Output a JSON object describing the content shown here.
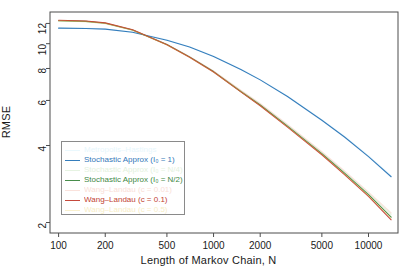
{
  "chart_data": {
    "type": "line",
    "title": "",
    "xlabel": "Length of Markov Chain, N",
    "ylabel": "RMSE",
    "xscale": "log",
    "yscale": "log",
    "xlim": [
      88,
      15500
    ],
    "ylim": [
      1.82,
      13.3
    ],
    "xticks": [
      100,
      200,
      500,
      1000,
      2000,
      5000,
      10000
    ],
    "xtick_labels": [
      "100",
      "200",
      "500",
      "1000",
      "2000",
      "5000",
      "10000"
    ],
    "yticks": [
      2,
      4,
      6,
      8,
      10,
      12
    ],
    "ytick_labels": [
      "2",
      "4",
      "6",
      "8",
      "10",
      "12"
    ],
    "grid": false,
    "legend_position": "lower-left-inside",
    "x": [
      100,
      150,
      200,
      300,
      500,
      700,
      1000,
      1500,
      2000,
      3000,
      5000,
      7000,
      10000,
      14000
    ],
    "series": [
      {
        "name": "Metropolis-Hastings",
        "label": "Metropolis–Hastings",
        "color": "#7fd4f2",
        "opacity": 0.16,
        "values": [
          11.55,
          11.5,
          11.42,
          11.1,
          10.35,
          9.72,
          8.95,
          7.95,
          7.25,
          6.25,
          5.05,
          4.35,
          3.65,
          3.05
        ]
      },
      {
        "name": "Stochastic Approx (I0 = 1)",
        "label": "Stochastic Approx (I₀ = 1)",
        "color": "#1f6fb5",
        "opacity": 0.9,
        "values": [
          11.5,
          11.46,
          11.4,
          11.08,
          10.32,
          9.7,
          8.92,
          7.92,
          7.22,
          6.22,
          5.02,
          4.32,
          3.62,
          3.02
        ]
      },
      {
        "name": "Stochastic Approx (I0 = N/4)",
        "label": "Stochastic Approx (I₀ = N/4)",
        "color": "#8ec77a",
        "opacity": 0.22,
        "values": [
          12.3,
          12.2,
          12.0,
          11.3,
          9.9,
          8.9,
          7.8,
          6.55,
          5.8,
          4.8,
          3.75,
          3.15,
          2.6,
          2.15
        ]
      },
      {
        "name": "Stochastic Approx (I0 = N/2)",
        "label": "Stochastic Approx (I₀ = N/2)",
        "color": "#2f7d32",
        "opacity": 0.88,
        "values": [
          12.3,
          12.22,
          12.02,
          11.32,
          9.92,
          8.88,
          7.78,
          6.5,
          5.76,
          4.76,
          3.72,
          3.12,
          2.57,
          2.1
        ]
      },
      {
        "name": "Wang-Landau (c = 0.01)",
        "label": "Wang–Landau (c = 0.01)",
        "color": "#f0a08a",
        "opacity": 0.3,
        "values": [
          12.32,
          12.24,
          12.05,
          11.35,
          9.95,
          8.92,
          7.82,
          6.58,
          5.84,
          4.84,
          3.78,
          3.18,
          2.63,
          2.18
        ]
      },
      {
        "name": "Wang-Landau (c = 0.1)",
        "label": "Wang–Landau (c = 0.1)",
        "color": "#c0392b",
        "opacity": 0.92,
        "values": [
          12.35,
          12.26,
          12.06,
          11.34,
          9.9,
          8.85,
          7.75,
          6.48,
          5.72,
          4.72,
          3.68,
          3.08,
          2.53,
          2.05
        ]
      },
      {
        "name": "Wang-Landau (c = 0.5)",
        "label": "Wang–Landau (c = 0.5)",
        "color": "#e8c84a",
        "opacity": 0.28,
        "values": [
          12.28,
          12.18,
          11.98,
          11.28,
          9.88,
          8.84,
          7.74,
          6.5,
          5.74,
          4.74,
          3.7,
          3.1,
          2.55,
          2.08
        ]
      }
    ]
  },
  "legend": {
    "entries": [
      "Metropolis–Hastings",
      "Stochastic Approx (I₀ = 1)",
      "Stochastic Approx (I₀ = N/4)",
      "Stochastic Approx (I₀ = N/2)",
      "Wang–Landau (c = 0.01)",
      "Wang–Landau (c = 0.1)",
      "Wang–Landau (c = 0.5)"
    ]
  },
  "axes": {
    "frame_color": "#4d4d4d"
  }
}
